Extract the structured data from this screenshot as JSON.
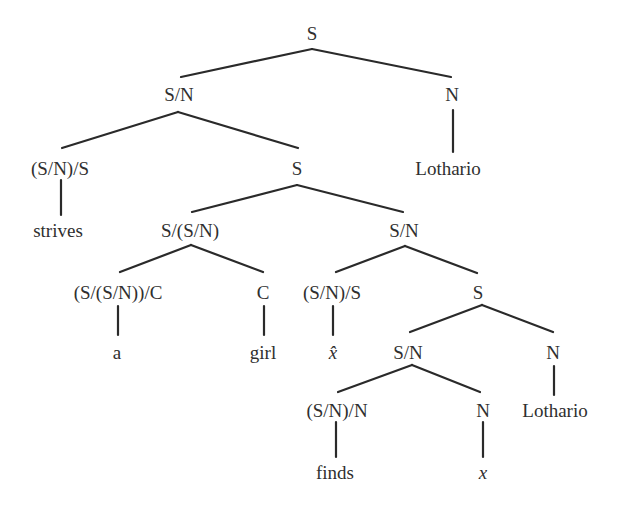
{
  "diagram": {
    "type": "ccg-derivation-tree",
    "stroke_color": "#2a2a2a",
    "text_color": "#2f2f2f",
    "nodes": [
      {
        "id": "n0",
        "label": "S",
        "x": 312,
        "y": 33
      },
      {
        "id": "n1",
        "label": "S/N",
        "x": 179,
        "y": 94
      },
      {
        "id": "n2",
        "label": "N",
        "x": 452,
        "y": 94
      },
      {
        "id": "n3",
        "label": "(S/N)/S",
        "x": 60,
        "y": 168
      },
      {
        "id": "n4",
        "label": "S",
        "x": 297,
        "y": 168
      },
      {
        "id": "n5",
        "label": "Lothario",
        "x": 448,
        "y": 168
      },
      {
        "id": "n6",
        "label": "strives",
        "x": 58,
        "y": 230
      },
      {
        "id": "n7",
        "label": "S/(S/N)",
        "x": 190,
        "y": 230
      },
      {
        "id": "n8",
        "label": "S/N",
        "x": 404,
        "y": 230
      },
      {
        "id": "n9",
        "label": "(S/(S/N))/C",
        "x": 118,
        "y": 292
      },
      {
        "id": "n10",
        "label": "C",
        "x": 263,
        "y": 292
      },
      {
        "id": "n11",
        "label": "(S/N)/S",
        "x": 332,
        "y": 292
      },
      {
        "id": "n12",
        "label": "S",
        "x": 478,
        "y": 292
      },
      {
        "id": "n13",
        "label": "a",
        "x": 117,
        "y": 352
      },
      {
        "id": "n14",
        "label": "girl",
        "x": 263,
        "y": 352
      },
      {
        "id": "n15",
        "label": "x̂",
        "x": 333,
        "y": 352,
        "italic": true
      },
      {
        "id": "n16",
        "label": "S/N",
        "x": 408,
        "y": 352
      },
      {
        "id": "n17",
        "label": "N",
        "x": 553,
        "y": 352
      },
      {
        "id": "n18",
        "label": "(S/N)/N",
        "x": 337,
        "y": 410
      },
      {
        "id": "n19",
        "label": "N",
        "x": 483,
        "y": 410
      },
      {
        "id": "n20",
        "label": "Lothario",
        "x": 555,
        "y": 410
      },
      {
        "id": "n21",
        "label": "finds",
        "x": 335,
        "y": 472
      },
      {
        "id": "n22",
        "label": "x",
        "x": 483,
        "y": 472,
        "italic": true
      }
    ],
    "edges": [
      {
        "from": "n0",
        "to": "n1",
        "x1": 312,
        "y1": 49,
        "x2": 181,
        "y2": 77
      },
      {
        "from": "n0",
        "to": "n2",
        "x1": 312,
        "y1": 49,
        "x2": 451,
        "y2": 77
      },
      {
        "from": "n1",
        "to": "n3",
        "x1": 178,
        "y1": 112,
        "x2": 62,
        "y2": 148
      },
      {
        "from": "n1",
        "to": "n4",
        "x1": 178,
        "y1": 112,
        "x2": 298,
        "y2": 148
      },
      {
        "from": "n2",
        "to": "n5",
        "x1": 453,
        "y1": 110,
        "x2": 453,
        "y2": 152
      },
      {
        "from": "n3",
        "to": "n6",
        "x1": 61,
        "y1": 180,
        "x2": 61,
        "y2": 215
      },
      {
        "from": "n4",
        "to": "n7",
        "x1": 297,
        "y1": 185,
        "x2": 192,
        "y2": 212
      },
      {
        "from": "n4",
        "to": "n8",
        "x1": 297,
        "y1": 185,
        "x2": 403,
        "y2": 212
      },
      {
        "from": "n7",
        "to": "n9",
        "x1": 191,
        "y1": 245,
        "x2": 120,
        "y2": 272
      },
      {
        "from": "n7",
        "to": "n10",
        "x1": 191,
        "y1": 245,
        "x2": 263,
        "y2": 272
      },
      {
        "from": "n8",
        "to": "n11",
        "x1": 405,
        "y1": 246,
        "x2": 336,
        "y2": 272
      },
      {
        "from": "n8",
        "to": "n12",
        "x1": 405,
        "y1": 246,
        "x2": 477,
        "y2": 273
      },
      {
        "from": "n9",
        "to": "n13",
        "x1": 118,
        "y1": 306,
        "x2": 118,
        "y2": 335
      },
      {
        "from": "n10",
        "to": "n14",
        "x1": 264,
        "y1": 306,
        "x2": 264,
        "y2": 335
      },
      {
        "from": "n11",
        "to": "n15",
        "x1": 333,
        "y1": 306,
        "x2": 333,
        "y2": 335
      },
      {
        "from": "n12",
        "to": "n16",
        "x1": 482,
        "y1": 305,
        "x2": 410,
        "y2": 332
      },
      {
        "from": "n12",
        "to": "n17",
        "x1": 482,
        "y1": 305,
        "x2": 553,
        "y2": 332
      },
      {
        "from": "n16",
        "to": "n18",
        "x1": 412,
        "y1": 365,
        "x2": 338,
        "y2": 392
      },
      {
        "from": "n16",
        "to": "n19",
        "x1": 412,
        "y1": 365,
        "x2": 480,
        "y2": 392
      },
      {
        "from": "n17",
        "to": "n20",
        "x1": 554,
        "y1": 366,
        "x2": 554,
        "y2": 395
      },
      {
        "from": "n18",
        "to": "n21",
        "x1": 336,
        "y1": 422,
        "x2": 336,
        "y2": 457
      },
      {
        "from": "n19",
        "to": "n22",
        "x1": 483,
        "y1": 422,
        "x2": 483,
        "y2": 457
      }
    ]
  }
}
